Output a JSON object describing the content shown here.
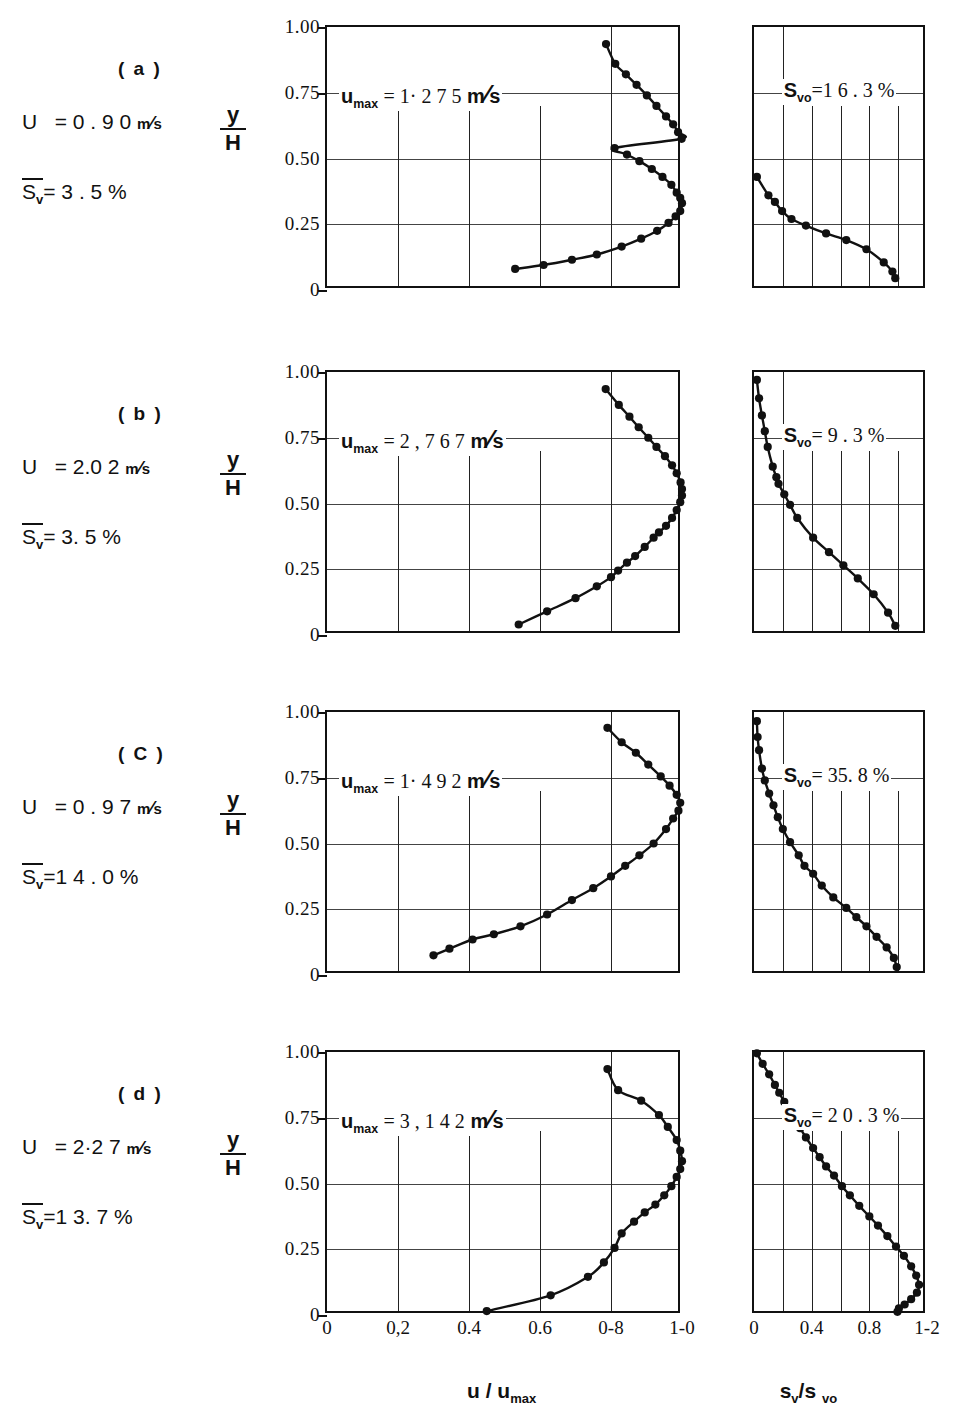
{
  "figure": {
    "x_axis_left_title": "u / u",
    "x_axis_left_title_sub": "max",
    "x_axis_right_title": "s",
    "x_axis_right_title_sub1": "v",
    "x_axis_right_title_mid": "/s",
    "x_axis_right_title_sub2": "vo",
    "y_axis_numerator": "y",
    "y_axis_denominator": "H",
    "y_ticks": [
      "1.00",
      "0.75",
      "0.50",
      "0.25",
      "0"
    ],
    "y_tick_values": [
      1.0,
      0.75,
      0.5,
      0.25,
      0
    ],
    "x_ticks_left": [
      "0",
      "0,2",
      "0.4",
      "0.6",
      "0-8",
      "1-0"
    ],
    "x_tick_values_left": [
      0,
      0.2,
      0.4,
      0.6,
      0.8,
      1.0
    ],
    "x_ticks_right": [
      "0",
      "0.4",
      "0.8",
      "1-2"
    ],
    "x_tick_values_right": [
      0,
      0.4,
      0.8,
      1.2
    ]
  },
  "panels": [
    {
      "id": "a",
      "letter": "( a )",
      "U_label": "U",
      "U_eq": "= 0 . 9 0",
      "U_unit_num": "m",
      "U_unit_den": "s",
      "sv_label": "S",
      "sv_sub": "v",
      "sv_eq": "= 3 . 5",
      "sv_unit": "%",
      "umax_annot_pre": "u",
      "umax_annot_sub": "max",
      "umax_annot_eq": "= 1· 2 7 5",
      "umax_annot_unit_num": "m",
      "umax_annot_unit_den": "s",
      "svo_annot_pre": "S",
      "svo_annot_sub": "vo",
      "svo_annot_val": "=1 6 . 3 %",
      "chart_data": {
        "type": "scatter",
        "title": "(a) velocity and concentration profiles",
        "xlabel": "u / u_max",
        "ylabel": "y/H",
        "xlim": [
          0,
          1.0
        ],
        "ylim": [
          0,
          1.0
        ],
        "grid": true,
        "series": [
          {
            "name": "u/umax vs y/H",
            "points_x": [
              0.999,
              0.989,
              0.975,
              0.955,
              0.928,
              0.901,
              0.872,
              0.842,
              0.812,
              0.786,
              0.81,
              0.845,
              0.88,
              0.915,
              0.945,
              0.97,
              0.985,
              0.995,
              1.0,
              0.995,
              0.982,
              0.962,
              0.93,
              0.885,
              0.83,
              0.76,
              0.69,
              0.61,
              0.53
            ],
            "points_y": [
              0.575,
              0.6,
              0.63,
              0.66,
              0.7,
              0.74,
              0.78,
              0.82,
              0.86,
              0.935,
              0.54,
              0.515,
              0.49,
              0.46,
              0.43,
              0.4,
              0.37,
              0.35,
              0.33,
              0.3,
              0.28,
              0.255,
              0.225,
              0.195,
              0.165,
              0.135,
              0.115,
              0.095,
              0.08
            ]
          }
        ]
      },
      "chart_data_right": {
        "type": "scatter",
        "xlabel": "s_v/s_vo",
        "ylabel": "y/H",
        "xlim": [
          0,
          1.2
        ],
        "ylim": [
          0,
          1.0
        ],
        "points_x": [
          0.02,
          0.1,
          0.145,
          0.195,
          0.26,
          0.36,
          0.5,
          0.64,
          0.78,
          0.9,
          0.96,
          0.98
        ],
        "points_y": [
          0.43,
          0.36,
          0.335,
          0.3,
          0.27,
          0.245,
          0.215,
          0.19,
          0.155,
          0.105,
          0.07,
          0.045
        ]
      }
    },
    {
      "id": "b",
      "letter": "( b )",
      "U_label": "U",
      "U_eq": "= 2.0 2",
      "U_unit_num": "m",
      "U_unit_den": "s",
      "sv_label": "S",
      "sv_sub": "v",
      "sv_eq": "= 3. 5",
      "sv_unit": "%",
      "umax_annot_pre": "u",
      "umax_annot_sub": "max",
      "umax_annot_eq": "= 2 , 7 6 7",
      "umax_annot_unit_num": "m",
      "umax_annot_unit_den": "s",
      "svo_annot_pre": "S",
      "svo_annot_sub": "vo",
      "svo_annot_val": "= 9 . 3 %",
      "chart_data": {
        "type": "scatter",
        "title": "(b) velocity and concentration profiles",
        "xlabel": "u / u_max",
        "ylabel": "y/H",
        "xlim": [
          0,
          1.0
        ],
        "ylim": [
          0,
          1.0
        ],
        "grid": true,
        "series": [
          {
            "name": "u/umax vs y/H",
            "points_x": [
              1.0,
              0.996,
              0.985,
              0.972,
              0.952,
              0.928,
              0.905,
              0.878,
              0.852,
              0.822,
              0.785,
              1.0,
              0.995,
              0.985,
              0.972,
              0.955,
              0.935,
              0.92,
              0.895,
              0.868,
              0.845,
              0.82,
              0.8,
              0.76,
              0.7,
              0.62,
              0.54
            ],
            "points_y": [
              0.555,
              0.58,
              0.615,
              0.645,
              0.68,
              0.715,
              0.75,
              0.79,
              0.83,
              0.875,
              0.935,
              0.53,
              0.505,
              0.475,
              0.445,
              0.415,
              0.39,
              0.37,
              0.335,
              0.3,
              0.275,
              0.245,
              0.22,
              0.185,
              0.14,
              0.09,
              0.04
            ]
          }
        ]
      },
      "chart_data_right": {
        "type": "scatter",
        "xlabel": "s_v/s_vo",
        "ylabel": "y/H",
        "xlim": [
          0,
          1.2
        ],
        "ylim": [
          0,
          1.0
        ],
        "points_x": [
          0.02,
          0.035,
          0.055,
          0.075,
          0.095,
          0.13,
          0.155,
          0.17,
          0.21,
          0.25,
          0.3,
          0.41,
          0.52,
          0.62,
          0.72,
          0.83,
          0.93,
          0.98
        ],
        "points_y": [
          0.97,
          0.9,
          0.835,
          0.775,
          0.715,
          0.64,
          0.6,
          0.575,
          0.535,
          0.495,
          0.445,
          0.37,
          0.315,
          0.265,
          0.215,
          0.155,
          0.085,
          0.035
        ]
      }
    },
    {
      "id": "c",
      "letter": "( C )",
      "U_label": "U",
      "U_eq": "= 0 . 9 7",
      "U_unit_num": "m",
      "U_unit_den": "s",
      "sv_label": "S",
      "sv_sub": "v",
      "sv_eq": "=1 4 . 0",
      "sv_unit": "%",
      "umax_annot_pre": "u",
      "umax_annot_sub": "max",
      "umax_annot_eq": "= 1· 4 9 2",
      "umax_annot_unit_num": "m",
      "umax_annot_unit_den": "s",
      "svo_annot_pre": "S",
      "svo_annot_sub": "vo",
      "svo_annot_val": "= 35. 8 %",
      "chart_data": {
        "type": "scatter",
        "title": "(c) velocity and concentration profiles",
        "xlabel": "u / u_max",
        "ylabel": "y/H",
        "xlim": [
          0,
          1.0
        ],
        "ylim": [
          0,
          1.0
        ],
        "grid": true,
        "series": [
          {
            "name": "u/umax vs y/H",
            "points_x": [
              0.995,
              0.985,
              0.965,
              0.94,
              0.905,
              0.87,
              0.83,
              0.79,
              0.99,
              0.975,
              0.955,
              0.92,
              0.88,
              0.84,
              0.8,
              0.75,
              0.69,
              0.62,
              0.545,
              0.47,
              0.41,
              0.345,
              0.3
            ],
            "points_y": [
              0.655,
              0.685,
              0.72,
              0.755,
              0.8,
              0.845,
              0.885,
              0.94,
              0.625,
              0.595,
              0.555,
              0.5,
              0.455,
              0.415,
              0.375,
              0.33,
              0.285,
              0.23,
              0.185,
              0.155,
              0.135,
              0.1,
              0.075
            ]
          }
        ]
      },
      "chart_data_right": {
        "type": "scatter",
        "xlabel": "s_v/s_vo",
        "ylabel": "y/H",
        "xlim": [
          0,
          1.2
        ],
        "ylim": [
          0,
          1.0
        ],
        "points_x": [
          0.02,
          0.025,
          0.035,
          0.055,
          0.075,
          0.105,
          0.135,
          0.165,
          0.2,
          0.25,
          0.31,
          0.35,
          0.41,
          0.47,
          0.55,
          0.64,
          0.71,
          0.78,
          0.85,
          0.92,
          0.97,
          0.99
        ],
        "points_y": [
          0.965,
          0.905,
          0.855,
          0.785,
          0.74,
          0.69,
          0.645,
          0.6,
          0.555,
          0.505,
          0.455,
          0.415,
          0.385,
          0.34,
          0.295,
          0.255,
          0.22,
          0.185,
          0.145,
          0.105,
          0.065,
          0.03
        ]
      }
    },
    {
      "id": "d",
      "letter": "( d )",
      "U_label": "U",
      "U_eq": "= 2·2 7",
      "U_unit_num": "m",
      "U_unit_den": "s",
      "sv_label": "S",
      "sv_sub": "v",
      "sv_eq": "=1 3. 7",
      "sv_unit": "%",
      "umax_annot_pre": "u",
      "umax_annot_sub": "max",
      "umax_annot_eq": "= 3 , 1 4 2",
      "umax_annot_unit_num": "m",
      "umax_annot_unit_den": "s",
      "svo_annot_pre": "S",
      "svo_annot_sub": "vo",
      "svo_annot_val": "= 2 0 . 3 %",
      "chart_data": {
        "type": "scatter",
        "title": "(d) velocity and concentration profiles",
        "xlabel": "u / u_max",
        "ylabel": "y/H",
        "xlim": [
          0,
          1.0
        ],
        "ylim": [
          0,
          1.0
        ],
        "grid": true,
        "series": [
          {
            "name": "u/umax vs y/H",
            "points_x": [
              1.0,
              0.995,
              0.985,
              0.96,
              0.935,
              0.885,
              0.82,
              0.79,
              0.995,
              0.985,
              0.97,
              0.95,
              0.925,
              0.895,
              0.865,
              0.83,
              0.81,
              0.78,
              0.735,
              0.63,
              0.45
            ],
            "points_y": [
              0.585,
              0.625,
              0.665,
              0.715,
              0.76,
              0.815,
              0.855,
              0.935,
              0.555,
              0.525,
              0.49,
              0.455,
              0.42,
              0.39,
              0.355,
              0.31,
              0.255,
              0.2,
              0.145,
              0.075,
              0.015
            ]
          }
        ]
      },
      "chart_data_right": {
        "type": "scatter",
        "xlabel": "s_v/s_vo",
        "ylabel": "y/H",
        "xlim": [
          0,
          1.2
        ],
        "ylim": [
          0,
          1.0
        ],
        "points_x": [
          0.02,
          0.06,
          0.105,
          0.145,
          0.175,
          0.21,
          0.245,
          0.285,
          0.32,
          0.36,
          0.41,
          0.455,
          0.5,
          0.555,
          0.61,
          0.665,
          0.73,
          0.8,
          0.86,
          0.925,
          0.985,
          1.04,
          1.09,
          1.125,
          1.145,
          1.13,
          1.09,
          1.045,
          1.005,
          0.995
        ],
        "points_y": [
          0.995,
          0.955,
          0.915,
          0.875,
          0.845,
          0.81,
          0.775,
          0.74,
          0.71,
          0.675,
          0.635,
          0.6,
          0.565,
          0.53,
          0.49,
          0.455,
          0.415,
          0.375,
          0.34,
          0.3,
          0.26,
          0.225,
          0.185,
          0.15,
          0.115,
          0.085,
          0.06,
          0.04,
          0.025,
          0.012
        ]
      }
    }
  ]
}
